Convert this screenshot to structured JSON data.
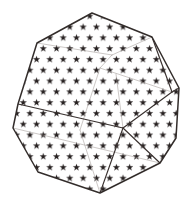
{
  "illustration": {
    "label": "star-patterned faceted polyhedron drawing",
    "background_color": "#ffffff"
  },
  "figure": {
    "viewbox": "0 0 185 216",
    "outline": [
      [
        92,
        13
      ],
      [
        152,
        37
      ],
      [
        179,
        88
      ],
      [
        176,
        138
      ],
      [
        160,
        163
      ],
      [
        100,
        193
      ],
      [
        38,
        172
      ],
      [
        13,
        128
      ],
      [
        18,
        104
      ],
      [
        37,
        43
      ]
    ],
    "thick_edges": [
      [
        [
          18,
          104
        ],
        [
          123,
          128
        ]
      ],
      [
        [
          123,
          128
        ],
        [
          172,
          92
        ]
      ],
      [
        [
          123,
          128
        ],
        [
          100,
          193
        ]
      ],
      [
        [
          123,
          128
        ],
        [
          160,
          163
        ]
      ],
      [
        [
          152,
          37
        ],
        [
          172,
          92
        ]
      ],
      [
        [
          172,
          92
        ],
        [
          179,
          88
        ]
      ]
    ],
    "thin_edges": [
      [
        [
          37,
          43
        ],
        [
          112,
          55
        ]
      ],
      [
        [
          112,
          55
        ],
        [
          152,
          37
        ]
      ],
      [
        [
          100,
          68
        ],
        [
          112,
          55
        ]
      ],
      [
        [
          100,
          68
        ],
        [
          172,
          92
        ]
      ],
      [
        [
          123,
          128
        ],
        [
          116,
          74
        ]
      ],
      [
        [
          100,
          68
        ],
        [
          80,
          130
        ]
      ],
      [
        [
          80,
          130
        ],
        [
          100,
          193
        ]
      ],
      [
        [
          13,
          128
        ],
        [
          160,
          163
        ]
      ]
    ],
    "stroke": {
      "outer_color": "#332d2b",
      "outer_width": 1.5,
      "thick_color": "#3a3230",
      "thick_width": 1.15,
      "thin_color": "#a19b96",
      "thin_width": 0.55
    },
    "star_pattern": {
      "color": "#272121",
      "outer_radius": 3.8,
      "inner_ratio": 0.4,
      "h_spacing": 13.3,
      "row_height": 10.8,
      "fill_background": "#ffffff"
    }
  }
}
